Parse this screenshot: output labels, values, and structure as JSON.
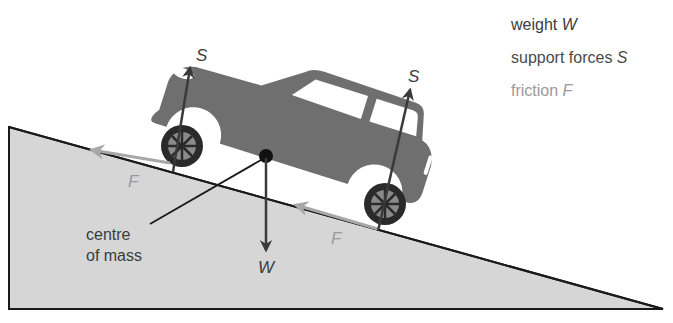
{
  "diagram": {
    "colors": {
      "slope_fill": "#d6d6d6",
      "slope_outline": "#1a1a1a",
      "car_body": "#6f6f6f",
      "window": "#ffffff",
      "tyre": "#2a2a2a",
      "weight_arrow": "#3a3a3a",
      "support_arrow": "#3a3a3a",
      "friction_arrow": "#a8a8a8",
      "label_dark": "#3c3c3c",
      "label_friction": "#9a9a9a"
    },
    "legend": [
      {
        "text": "weight ",
        "symbol": "W",
        "color": "#3c3c3c"
      },
      {
        "text": "support forces ",
        "symbol": "S",
        "color": "#4a4a4a"
      },
      {
        "text": "friction ",
        "symbol": "F",
        "color": "#9a9a9a"
      }
    ],
    "labels": {
      "support_rear": "S",
      "support_front": "S",
      "friction_rear": "F",
      "friction_front": "F",
      "weight": "W",
      "centre_of_mass_line1": "centre",
      "centre_of_mass_line2": "of mass"
    }
  }
}
